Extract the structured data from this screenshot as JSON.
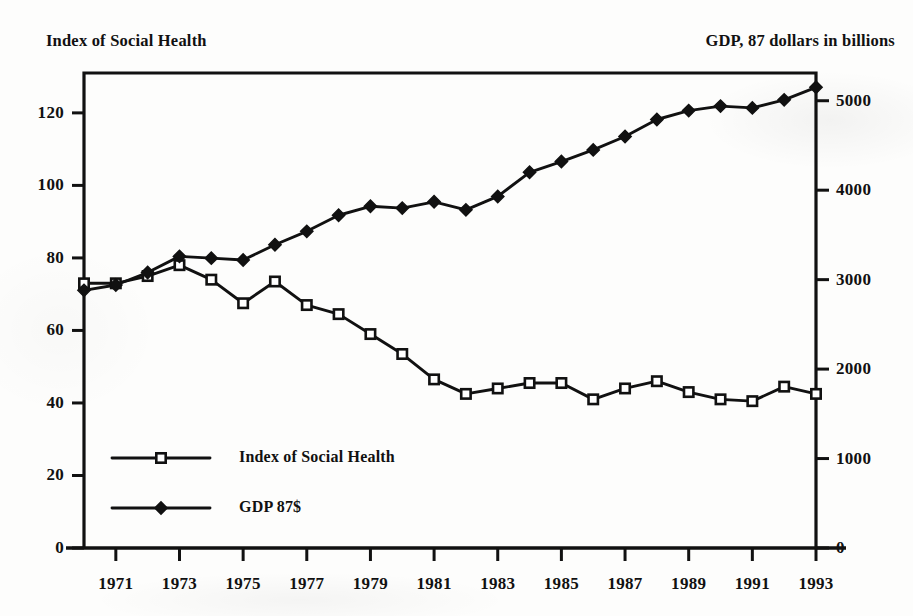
{
  "chart_data": {
    "type": "line",
    "title": "",
    "xlabel": "",
    "ylabel": "Index of Social Health",
    "y2label": "GDP, 87 dollars in billions",
    "grid": false,
    "legend_position": "inside-lower-left",
    "x": [
      1970,
      1971,
      1972,
      1973,
      1974,
      1975,
      1976,
      1977,
      1978,
      1979,
      1980,
      1981,
      1982,
      1983,
      1984,
      1985,
      1986,
      1987,
      1988,
      1989,
      1990,
      1991,
      1992,
      1993
    ],
    "xlim": [
      1970,
      1993
    ],
    "xticks": [
      1971,
      1973,
      1975,
      1977,
      1979,
      1981,
      1983,
      1985,
      1987,
      1989,
      1991,
      1993
    ],
    "xticklabels": [
      "1971",
      "1973",
      "1975",
      "1977",
      "1979",
      "1981",
      "1983",
      "1985",
      "1987",
      "1989",
      "1991",
      "1993"
    ],
    "ylim": [
      0,
      131
    ],
    "yticks": [
      0,
      20,
      40,
      60,
      80,
      100,
      120
    ],
    "yticklabels": [
      "0",
      "20",
      "40",
      "60",
      "80",
      "100",
      "120"
    ],
    "y2lim": [
      0,
      5310
    ],
    "y2ticks": [
      0,
      1000,
      2000,
      3000,
      4000,
      5000
    ],
    "y2ticklabels": [
      "0",
      "1000",
      "2000",
      "3000",
      "4000",
      "5000"
    ],
    "series": [
      {
        "name": "Index of Social Health",
        "axis": "left",
        "marker": "open-square",
        "color": "#111111",
        "values": [
          73,
          73,
          75,
          78,
          74,
          67.5,
          73.5,
          67,
          64.5,
          59,
          53.5,
          46.5,
          42.5,
          44,
          45.5,
          45.5,
          41,
          44,
          46,
          43,
          41,
          40.5,
          44.5,
          42.5
        ]
      },
      {
        "name": "GDP 87$",
        "axis": "right",
        "marker": "filled-diamond",
        "color": "#111111",
        "values": [
          2880,
          2940,
          3080,
          3260,
          3240,
          3220,
          3390,
          3540,
          3720,
          3820,
          3800,
          3870,
          3780,
          3930,
          4200,
          4320,
          4450,
          4600,
          4790,
          4890,
          4940,
          4920,
          5010,
          5150
        ]
      }
    ]
  },
  "titles": {
    "left": "Index of Social Health",
    "right": "GDP, 87 dollars in billions"
  },
  "legend": {
    "items": [
      {
        "label": "Index of Social Health",
        "marker": "open-square"
      },
      {
        "label": "GDP 87$",
        "marker": "filled-diamond"
      }
    ]
  }
}
